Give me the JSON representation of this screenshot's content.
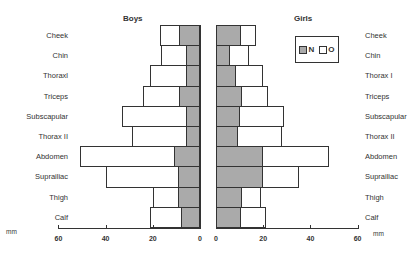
{
  "chart_data": [
    {
      "type": "bar",
      "orientation": "horizontal",
      "title": "Boys",
      "xlabel": "mm",
      "xlim": [
        60,
        0
      ],
      "xticks": [
        "60",
        "40",
        "20",
        "0"
      ],
      "categories": [
        "Cheek",
        "Chin",
        "Thoraxl",
        "Triceps",
        "Subscapular",
        "Thorax II",
        "Abdomen",
        "Suprailiac",
        "Thigh",
        "Calf"
      ],
      "series": [
        {
          "name": "N",
          "color": "#aaaaaa",
          "values": [
            9,
            6,
            6,
            9,
            6,
            6,
            11,
            9.5,
            9.5,
            8
          ]
        },
        {
          "name": "O",
          "color": "#ffffff",
          "values": [
            17,
            16.5,
            21,
            24,
            33,
            29,
            51,
            40,
            20,
            21
          ]
        }
      ]
    },
    {
      "type": "bar",
      "orientation": "horizontal",
      "title": "Girls",
      "xlabel": "mm",
      "xlim": [
        0,
        60
      ],
      "xticks": [
        "0",
        "20",
        "40",
        "60"
      ],
      "categories": [
        "Cheek",
        "Chin",
        "Thorax I",
        "Triceps",
        "Subscapular",
        "Thorax II",
        "Abdomen",
        "Suprailiac",
        "Thigh",
        "Calf"
      ],
      "series": [
        {
          "name": "N",
          "color": "#aaaaaa",
          "values": [
            10.5,
            6,
            8.5,
            11,
            10,
            9.5,
            20,
            20,
            11,
            10.5
          ]
        },
        {
          "name": "O",
          "color": "#ffffff",
          "values": [
            17,
            14,
            20,
            22,
            29,
            28,
            48,
            35,
            19,
            21
          ]
        }
      ]
    }
  ],
  "labels": {
    "boys_title": "Boys",
    "girls_title": "Girls",
    "unit": "mm",
    "legend_n": "N",
    "legend_o": "O"
  }
}
